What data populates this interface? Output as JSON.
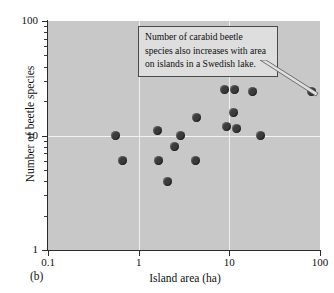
{
  "figure": {
    "panel_label": "(b)",
    "background_color": "#c8c8c8",
    "point_color": "#3b3b3b",
    "gridline_color": "#efefef",
    "axis_color": "#2b2b2b"
  },
  "annotation": {
    "text": "Number of carabid beetle species also increases with area on islands in a Swedish lake.",
    "box_fill": "#dedede",
    "box_border": "#4a4a4a"
  },
  "chart_data": {
    "type": "scatter",
    "title": "",
    "xlabel": "Island area (ha)",
    "ylabel": "Number of beetle species",
    "xscale": "log",
    "yscale": "log",
    "xlim": [
      0.1,
      100
    ],
    "ylim": [
      1,
      100
    ],
    "xticks": [
      "0.1",
      "1",
      "10",
      "100"
    ],
    "xtick_values": [
      0.1,
      1,
      10,
      100
    ],
    "yticks": [
      "1",
      "10",
      "100"
    ],
    "ytick_values": [
      1,
      10,
      100
    ],
    "grid": true,
    "legend": "none",
    "points": [
      {
        "x": 0.55,
        "y": 10.0
      },
      {
        "x": 0.66,
        "y": 6.0
      },
      {
        "x": 1.6,
        "y": 11.0
      },
      {
        "x": 1.65,
        "y": 6.0
      },
      {
        "x": 2.1,
        "y": 4.0
      },
      {
        "x": 2.5,
        "y": 8.0
      },
      {
        "x": 2.9,
        "y": 10.0
      },
      {
        "x": 4.2,
        "y": 6.0
      },
      {
        "x": 4.3,
        "y": 14.5
      },
      {
        "x": 8.9,
        "y": 25.0
      },
      {
        "x": 9.2,
        "y": 12.0
      },
      {
        "x": 11.2,
        "y": 16.0
      },
      {
        "x": 11.5,
        "y": 25.0
      },
      {
        "x": 11.9,
        "y": 11.5
      },
      {
        "x": 18.0,
        "y": 24.0
      },
      {
        "x": 22.0,
        "y": 10.0
      },
      {
        "x": 80.0,
        "y": 24.0
      }
    ]
  }
}
